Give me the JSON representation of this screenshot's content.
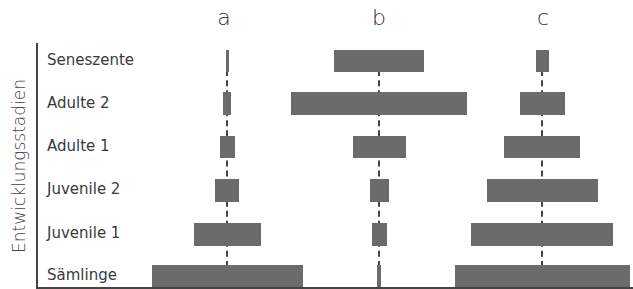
{
  "chart_data": {
    "type": "bar",
    "subtype": "population-pyramid (centered horizontal bars)",
    "title": "",
    "ylabel": "Entwicklungsstadien",
    "xlabel": "",
    "categories": [
      "Seneszente",
      "Adulte 2",
      "Adulte 1",
      "Juvenile 2",
      "Juvenile 1",
      "Sämlinge"
    ],
    "panels": [
      "a",
      "b",
      "c"
    ],
    "series": [
      {
        "name": "a",
        "center_x": 227,
        "widths_px": [
          3,
          8,
          15,
          24,
          67,
          151
        ]
      },
      {
        "name": "b",
        "center_x": 379,
        "widths_px": [
          90,
          176,
          53,
          19,
          15,
          4
        ]
      },
      {
        "name": "c",
        "center_x": 542,
        "widths_px": [
          13,
          45,
          76,
          111,
          142,
          175
        ]
      }
    ],
    "grid": false,
    "legend": "none",
    "units": "relative bar width (no numeric axis)"
  },
  "panel_titles": [
    "a",
    "b",
    "c"
  ],
  "axis": {
    "y_title": "Entwicklungsstadien"
  },
  "rows": [
    {
      "label": "Seneszente",
      "top": 50,
      "height": 22,
      "label_top": 50
    },
    {
      "label": "Adulte 2",
      "top": 92,
      "height": 23,
      "label_top": 93
    },
    {
      "label": "Adulte 1",
      "top": 136,
      "height": 22,
      "label_top": 136
    },
    {
      "label": "Juvenile 2",
      "top": 179,
      "height": 23,
      "label_top": 179
    },
    {
      "label": "Juvenile 1",
      "top": 223,
      "height": 23,
      "label_top": 223
    },
    {
      "label": "Sämlinge",
      "top": 265,
      "height": 22,
      "label_top": 265
    }
  ],
  "colors": {
    "bar": "#6b6b6b",
    "axis": "#444444",
    "text": "#3a3a3a"
  }
}
